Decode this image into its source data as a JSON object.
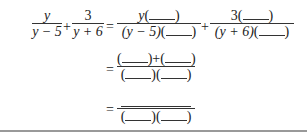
{
  "expression": {
    "line1": {
      "term1": {
        "numerator": "y",
        "denominator": "y − 5"
      },
      "plus": "+",
      "term2": {
        "numerator": "3",
        "denominator": "y + 6"
      },
      "equals": "=",
      "rhs1": {
        "numerator_prefix": "y",
        "denominator_prefix": "(y − 5)"
      },
      "plus2": "+",
      "rhs2": {
        "numerator_prefix": "3",
        "denominator_prefix": "(y + 6)"
      }
    },
    "line2": {
      "equals": "=",
      "plus": "+"
    },
    "line3": {
      "equals": "="
    }
  },
  "symbols": {
    "open": "(",
    "close": ")"
  }
}
